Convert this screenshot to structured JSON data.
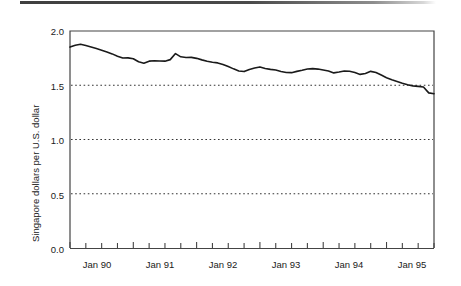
{
  "figure": {
    "name": "singapore-dollar-exchange-rate-chart",
    "top_rule_color": "#3f3f3f",
    "background": "#ffffff"
  },
  "chart_data": {
    "type": "line",
    "title": "",
    "subtitle": "",
    "xlabel": "",
    "ylabel": "Singapore dollars per U.S. dollar",
    "ylim": [
      0.0,
      2.0
    ],
    "y_ticks": [
      0.0,
      0.5,
      1.0,
      1.5,
      2.0
    ],
    "y_tick_labels": [
      "0.0",
      "0.5",
      "1.0",
      "1.5",
      "2.0"
    ],
    "grid": true,
    "gridlines_at": [
      0.5,
      1.0,
      1.5
    ],
    "grid_style": "dotted",
    "grid_color": "#333333",
    "legend": false,
    "legend_position": "none",
    "line_color": "#1a1a1a",
    "line_width": 1.6,
    "x_tick_labels": [
      "Jan 90",
      "Jan 91",
      "Jan 92",
      "Jan 93",
      "Jan 94",
      "Jan 95"
    ],
    "x_major_tick_positions": [
      0,
      12,
      24,
      36,
      48,
      60
    ],
    "x_minor_tick_interval_months": 3,
    "x_range_months": [
      0,
      69
    ],
    "x_axis_start": "Jan 90",
    "x_axis_end": "Oct 95",
    "series": [
      {
        "name": "Singapore dollars per U.S. dollar",
        "x": [
          0,
          1,
          2,
          3,
          4,
          5,
          6,
          7,
          8,
          9,
          10,
          11,
          12,
          13,
          14,
          15,
          16,
          17,
          18,
          19,
          20,
          21,
          22,
          23,
          24,
          25,
          26,
          27,
          28,
          29,
          30,
          31,
          32,
          33,
          34,
          35,
          36,
          37,
          38,
          39,
          40,
          41,
          42,
          43,
          44,
          45,
          46,
          47,
          48,
          49,
          50,
          51,
          52,
          53,
          54,
          55,
          56,
          57,
          58,
          59,
          60,
          61,
          62,
          63,
          64,
          65,
          66,
          67,
          68,
          69
        ],
        "values": [
          1.852,
          1.869,
          1.878,
          1.866,
          1.852,
          1.838,
          1.823,
          1.806,
          1.789,
          1.768,
          1.751,
          1.752,
          1.744,
          1.716,
          1.703,
          1.722,
          1.726,
          1.724,
          1.722,
          1.736,
          1.792,
          1.762,
          1.756,
          1.757,
          1.748,
          1.734,
          1.722,
          1.712,
          1.706,
          1.692,
          1.672,
          1.651,
          1.632,
          1.626,
          1.646,
          1.659,
          1.669,
          1.655,
          1.646,
          1.64,
          1.627,
          1.618,
          1.616,
          1.628,
          1.638,
          1.65,
          1.653,
          1.649,
          1.641,
          1.632,
          1.614,
          1.622,
          1.632,
          1.629,
          1.617,
          1.6,
          1.608,
          1.628,
          1.617,
          1.594,
          1.57,
          1.551,
          1.535,
          1.518,
          1.505,
          1.494,
          1.49,
          1.484,
          1.43,
          1.422
        ]
      }
    ]
  },
  "axes": {
    "y_title": "Singapore dollars per U.S. dollar",
    "y_labels": [
      "2.0",
      "1.5",
      "1.0",
      "0.5",
      "0.0"
    ],
    "x_labels": [
      "Jan 90",
      "Jan 91",
      "Jan 92",
      "Jan 93",
      "Jan 94",
      "Jan 95"
    ]
  }
}
